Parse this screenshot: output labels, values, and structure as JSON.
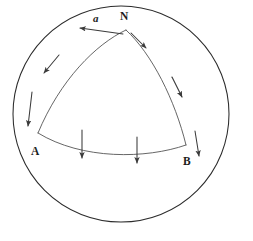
{
  "figure": {
    "type": "diagram",
    "canvas": {
      "width": 253,
      "height": 241,
      "background": "#ffffff"
    },
    "stroke_colors": {
      "sphere": "#2b2b2b",
      "geodesic": "#4a4a4a",
      "vector": "#3a3a3a"
    }
  },
  "sphere": {
    "name": "sphere-outline",
    "center": {
      "x": 121,
      "y": 114
    },
    "radius": 108
  },
  "vertices": [
    {
      "id": "N",
      "label": "N",
      "x": 126,
      "y": 30,
      "label_x": 120,
      "label_y": 11
    },
    {
      "id": "A",
      "label": "A",
      "x": 38,
      "y": 133,
      "label_x": 31,
      "label_y": 146
    },
    {
      "id": "B",
      "label": "B",
      "x": 186,
      "y": 145,
      "label_x": 183,
      "label_y": 156
    }
  ],
  "edges": [
    {
      "id": "NA",
      "from": "N",
      "to": "A",
      "path": "M126,30 C96,44 60,80 38,133"
    },
    {
      "id": "NB",
      "from": "N",
      "to": "B",
      "path": "M126,30 C152,54 175,100 186,145"
    },
    {
      "id": "AB",
      "from": "A",
      "to": "B",
      "path": "M38,133 C82,160 146,159 186,145"
    }
  ],
  "vectors": {
    "label": "a",
    "label_x": 93,
    "label_y": 13,
    "items": [
      {
        "id": "v-apex-left",
        "edge": "NA",
        "path": "M123,34 L80,28"
      },
      {
        "id": "v-apex-right",
        "edge": "NB",
        "path": "M131,33 L146,48"
      },
      {
        "id": "v-na-mid",
        "edge": "NA",
        "path": "M59,55 L44,73"
      },
      {
        "id": "v-na-low",
        "edge": "NA",
        "path": "M32,92 L28,126"
      },
      {
        "id": "v-nb-mid",
        "edge": "NB",
        "path": "M172,77 L182,97"
      },
      {
        "id": "v-nb-low",
        "edge": "NB",
        "path": "M195,131 L199,156"
      },
      {
        "id": "v-ab-left",
        "edge": "AB",
        "path": "M82,130 L82,158"
      },
      {
        "id": "v-ab-right",
        "edge": "AB",
        "path": "M137,137 L137,163"
      }
    ]
  }
}
